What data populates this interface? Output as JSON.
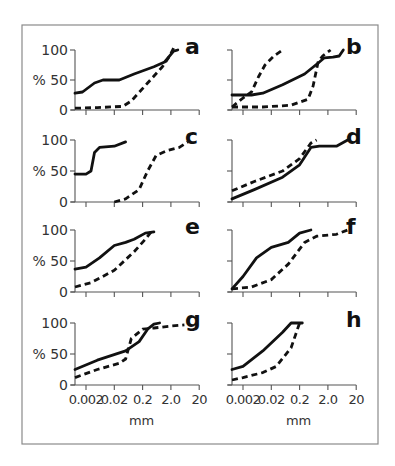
{
  "figure": {
    "y_axis_label": "%",
    "y_ticks": [
      "100",
      "50",
      "0"
    ],
    "x_ticks": [
      "0.002",
      "0.02",
      "0.2",
      "2.0",
      "20"
    ],
    "x_unit": "mm"
  },
  "chart_data": {
    "type": "line",
    "title": "",
    "xlabel": "mm",
    "ylabel": "%",
    "xscale": "log",
    "xticks": [
      0.002,
      0.02,
      0.2,
      2.0,
      20
    ],
    "ylim": [
      0,
      100
    ],
    "yticks": [
      0,
      50,
      100
    ],
    "grid": false,
    "legend": null,
    "panels": [
      {
        "label": "a",
        "series": [
          {
            "name": "solid",
            "style": "solid",
            "points": [
              [
                0.0008,
                28
              ],
              [
                0.0015,
                30
              ],
              [
                0.004,
                45
              ],
              [
                0.008,
                50
              ],
              [
                0.03,
                50
              ],
              [
                0.1,
                60
              ],
              [
                0.5,
                72
              ],
              [
                1.2,
                80
              ],
              [
                2.5,
                98
              ],
              [
                3.5,
                100
              ]
            ]
          },
          {
            "name": "dashed",
            "style": "dashed",
            "points": [
              [
                0.0008,
                3
              ],
              [
                0.005,
                4
              ],
              [
                0.04,
                6
              ],
              [
                0.08,
                15
              ],
              [
                0.3,
                45
              ],
              [
                1,
                72
              ],
              [
                1.8,
                90
              ],
              [
                2.5,
                103
              ]
            ]
          }
        ]
      },
      {
        "label": "b",
        "series": [
          {
            "name": "solid",
            "style": "solid",
            "points": [
              [
                0.0008,
                25
              ],
              [
                0.004,
                25
              ],
              [
                0.01,
                28
              ],
              [
                0.05,
                42
              ],
              [
                0.3,
                60
              ],
              [
                1,
                80
              ],
              [
                1.5,
                87
              ],
              [
                3,
                88
              ],
              [
                5,
                90
              ],
              [
                7,
                100
              ]
            ]
          },
          {
            "name": "dashed-1",
            "style": "dashed",
            "points": [
              [
                0.0008,
                5
              ],
              [
                0.002,
                20
              ],
              [
                0.004,
                30
              ],
              [
                0.007,
                55
              ],
              [
                0.012,
                75
              ],
              [
                0.025,
                90
              ],
              [
                0.05,
                100
              ]
            ]
          },
          {
            "name": "dashed-2",
            "style": "dashed",
            "points": [
              [
                0.0008,
                5
              ],
              [
                0.01,
                5
              ],
              [
                0.1,
                8
              ],
              [
                0.4,
                18
              ],
              [
                0.6,
                40
              ],
              [
                0.9,
                80
              ],
              [
                1.3,
                90
              ],
              [
                2.5,
                100
              ]
            ]
          }
        ]
      },
      {
        "label": "c",
        "series": [
          {
            "name": "solid",
            "style": "solid",
            "points": [
              [
                0.0008,
                45
              ],
              [
                0.002,
                45
              ],
              [
                0.003,
                50
              ],
              [
                0.004,
                80
              ],
              [
                0.006,
                88
              ],
              [
                0.02,
                90
              ],
              [
                0.05,
                97
              ]
            ]
          },
          {
            "name": "dashed",
            "style": "dashed",
            "points": [
              [
                0.02,
                0
              ],
              [
                0.05,
                5
              ],
              [
                0.15,
                20
              ],
              [
                0.3,
                50
              ],
              [
                0.6,
                75
              ],
              [
                1.5,
                83
              ],
              [
                4,
                88
              ],
              [
                8,
                97
              ]
            ]
          }
        ]
      },
      {
        "label": "d",
        "series": [
          {
            "name": "solid",
            "style": "solid",
            "points": [
              [
                0.0008,
                5
              ],
              [
                0.005,
                20
              ],
              [
                0.05,
                40
              ],
              [
                0.2,
                60
              ],
              [
                0.5,
                88
              ],
              [
                1,
                90
              ],
              [
                4,
                90
              ],
              [
                10,
                100
              ]
            ]
          },
          {
            "name": "dashed",
            "style": "dashed",
            "points": [
              [
                0.0008,
                18
              ],
              [
                0.005,
                33
              ],
              [
                0.05,
                50
              ],
              [
                0.2,
                70
              ],
              [
                0.5,
                95
              ],
              [
                0.8,
                100
              ]
            ]
          }
        ]
      },
      {
        "label": "e",
        "series": [
          {
            "name": "solid",
            "style": "solid",
            "points": [
              [
                0.0008,
                37
              ],
              [
                0.002,
                40
              ],
              [
                0.006,
                55
              ],
              [
                0.02,
                75
              ],
              [
                0.05,
                80
              ],
              [
                0.1,
                85
              ],
              [
                0.25,
                95
              ],
              [
                0.5,
                97
              ]
            ]
          },
          {
            "name": "dashed",
            "style": "dashed",
            "points": [
              [
                0.0008,
                8
              ],
              [
                0.003,
                15
              ],
              [
                0.02,
                35
              ],
              [
                0.1,
                65
              ],
              [
                0.25,
                85
              ],
              [
                0.4,
                97
              ]
            ]
          }
        ]
      },
      {
        "label": "f",
        "series": [
          {
            "name": "solid",
            "style": "solid",
            "points": [
              [
                0.0008,
                5
              ],
              [
                0.002,
                25
              ],
              [
                0.006,
                55
              ],
              [
                0.02,
                72
              ],
              [
                0.08,
                80
              ],
              [
                0.2,
                95
              ],
              [
                0.5,
                100
              ]
            ]
          },
          {
            "name": "dashed",
            "style": "dashed",
            "points": [
              [
                0.0008,
                5
              ],
              [
                0.004,
                8
              ],
              [
                0.02,
                20
              ],
              [
                0.08,
                45
              ],
              [
                0.3,
                80
              ],
              [
                0.8,
                90
              ],
              [
                4,
                93
              ],
              [
                10,
                100
              ]
            ]
          }
        ]
      },
      {
        "label": "g",
        "series": [
          {
            "name": "solid",
            "style": "solid",
            "points": [
              [
                0.0008,
                25
              ],
              [
                0.005,
                40
              ],
              [
                0.05,
                55
              ],
              [
                0.15,
                70
              ],
              [
                0.3,
                90
              ],
              [
                0.5,
                98
              ],
              [
                0.8,
                100
              ]
            ]
          },
          {
            "name": "dashed",
            "style": "dashed",
            "points": [
              [
                0.0008,
                12
              ],
              [
                0.005,
                25
              ],
              [
                0.03,
                35
              ],
              [
                0.05,
                42
              ],
              [
                0.08,
                75
              ],
              [
                0.2,
                90
              ],
              [
                0.5,
                92
              ],
              [
                2,
                95
              ],
              [
                6,
                97
              ]
            ]
          }
        ]
      },
      {
        "label": "h",
        "series": [
          {
            "name": "solid",
            "style": "solid",
            "points": [
              [
                0.0008,
                25
              ],
              [
                0.002,
                30
              ],
              [
                0.01,
                55
              ],
              [
                0.05,
                85
              ],
              [
                0.1,
                100
              ],
              [
                0.25,
                100
              ]
            ]
          },
          {
            "name": "dashed",
            "style": "dashed",
            "points": [
              [
                0.0008,
                8
              ],
              [
                0.002,
                12
              ],
              [
                0.01,
                20
              ],
              [
                0.03,
                30
              ],
              [
                0.1,
                60
              ],
              [
                0.2,
                100
              ]
            ]
          }
        ]
      }
    ]
  }
}
